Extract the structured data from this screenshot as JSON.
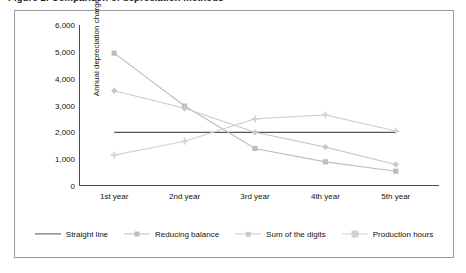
{
  "figure": {
    "title": "Figure 1: Comparison of depreciation methods"
  },
  "colors": {
    "straight_line": "#555555",
    "reducing_balance": "#bdbdbd",
    "sum_of_digits": "#c9c9c9",
    "production_hours": "#d2d2d2",
    "axis": "#4a4a4a",
    "frame": "#9a9a9a",
    "text": "#111111",
    "background": "#ffffff"
  },
  "legend": {
    "position": "bottom",
    "items": [
      {
        "label": "Straight line",
        "marker": "none",
        "color": "#555555"
      },
      {
        "label": "Reducing balance",
        "marker": "square",
        "color": "#bdbdbd"
      },
      {
        "label": "Sum of the digits",
        "marker": "diamond",
        "color": "#c9c9c9"
      },
      {
        "label": "Production hours",
        "marker": "cross",
        "color": "#d2d2d2"
      }
    ]
  },
  "chart_data": {
    "type": "line",
    "title": "",
    "xlabel": "",
    "ylabel": "Annual depreciation charge",
    "categories": [
      "1st year",
      "2nd year",
      "3rd year",
      "4th year",
      "5th year"
    ],
    "ylim": [
      0,
      6000
    ],
    "yticks": [
      0,
      1000,
      2000,
      3000,
      4000,
      5000,
      6000
    ],
    "ytick_labels": [
      "0",
      "1,000",
      "2,000",
      "3,000",
      "4,000",
      "5,000",
      "6,000"
    ],
    "grid": false,
    "series": [
      {
        "name": "Straight line",
        "marker": "none",
        "color": "#555555",
        "values": [
          2000,
          2000,
          2000,
          2000,
          2000
        ]
      },
      {
        "name": "Reducing balance",
        "marker": "square",
        "color": "#bdbdbd",
        "values": [
          4950,
          2980,
          1400,
          900,
          550
        ]
      },
      {
        "name": "Sum of the digits",
        "marker": "diamond",
        "color": "#c9c9c9",
        "values": [
          3550,
          2900,
          2000,
          1450,
          800
        ]
      },
      {
        "name": "Production hours",
        "marker": "cross",
        "color": "#d2d2d2",
        "values": [
          1150,
          1670,
          2500,
          2650,
          2050
        ]
      }
    ]
  }
}
